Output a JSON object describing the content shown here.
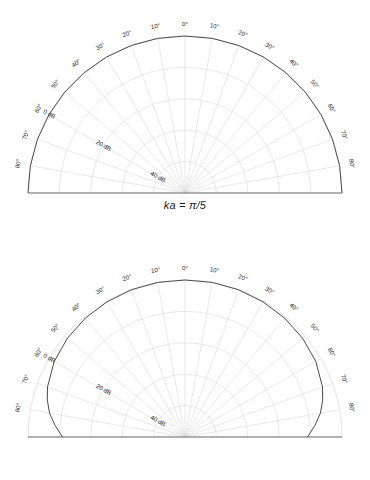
{
  "figure": {
    "type": "polar-directivity-figure",
    "background": "#ffffff",
    "panel_count": 2
  },
  "style": {
    "curve_color": "#4a4a4a",
    "grid_color": "#d9d9d9",
    "axis_color": "#6e6e6e",
    "text_color": "#2b2b2b"
  },
  "chart_data": [
    {
      "type": "line",
      "subtype": "polar-half",
      "title": "ka = π/5",
      "xlabel": "Angle (degrees)",
      "ylabel": "Level (dB)",
      "grid": true,
      "legend": null,
      "theta_range_deg": [
        -90,
        90
      ],
      "theta_tick_step_deg": 10,
      "theta_ticks_deg": [
        -80,
        -70,
        -60,
        -50,
        -40,
        -30,
        -20,
        -10,
        0,
        10,
        20,
        30,
        40,
        50,
        60,
        70,
        80
      ],
      "theta_tick_labels": [
        "80°",
        "70°",
        "60°",
        "50°",
        "40°",
        "30°",
        "20°",
        "10°",
        "0°",
        "10°",
        "20°",
        "30°",
        "40°",
        "50°",
        "60°",
        "70°",
        "80°"
      ],
      "radial_ticks_db": [
        0,
        20,
        40
      ],
      "radial_tick_labels": [
        "0 dB",
        "20 dB",
        "40 dB"
      ],
      "radial_label_angle_deg": -60,
      "radial_min_db": -50,
      "radial_max_db": 0,
      "ring_count": 5,
      "ring_step_db": 10,
      "series": [
        {
          "name": "ka = π/5",
          "theta_deg": [
            -90,
            -80,
            -70,
            -60,
            -50,
            -40,
            -30,
            -20,
            -10,
            0,
            10,
            20,
            30,
            40,
            50,
            60,
            70,
            80,
            90
          ],
          "values_db": [
            0,
            0,
            0,
            0,
            0,
            0,
            0,
            0,
            0,
            0,
            0,
            0,
            0,
            0,
            0,
            0,
            0,
            0,
            0
          ]
        }
      ]
    },
    {
      "type": "line",
      "subtype": "polar-half",
      "title": "ka = π",
      "xlabel": "Angle (degrees)",
      "ylabel": "Level (dB)",
      "grid": true,
      "legend": null,
      "theta_range_deg": [
        -90,
        90
      ],
      "theta_tick_step_deg": 10,
      "theta_ticks_deg": [
        -80,
        -70,
        -60,
        -50,
        -40,
        -30,
        -20,
        -10,
        0,
        10,
        20,
        30,
        40,
        50,
        60,
        70,
        80
      ],
      "theta_tick_labels": [
        "80°",
        "70°",
        "60°",
        "50°",
        "40°",
        "30°",
        "20°",
        "10°",
        "0°",
        "10°",
        "20°",
        "30°",
        "40°",
        "50°",
        "60°",
        "70°",
        "80°"
      ],
      "radial_ticks_db": [
        0,
        20,
        40
      ],
      "radial_tick_labels": [
        "0 dB",
        "20 dB",
        "40 dB"
      ],
      "radial_label_angle_deg": -60,
      "radial_min_db": -50,
      "radial_max_db": 0,
      "ring_count": 5,
      "ring_step_db": 10,
      "series": [
        {
          "name": "ka = π",
          "theta_deg": [
            -90,
            -85,
            -80,
            -75,
            -70,
            -60,
            -50,
            -40,
            -30,
            -20,
            -10,
            0,
            10,
            20,
            30,
            40,
            50,
            60,
            70,
            75,
            80,
            85,
            90
          ],
          "values_db": [
            -11.0,
            -8.5,
            -6.2,
            -4.6,
            -3.4,
            -1.9,
            -1.1,
            -0.6,
            -0.3,
            -0.1,
            0.0,
            0.0,
            0.0,
            -0.1,
            -0.3,
            -0.6,
            -1.1,
            -1.9,
            -3.4,
            -4.6,
            -6.2,
            -8.5,
            -11.0
          ]
        }
      ]
    }
  ],
  "panels": [
    {
      "caption": "ka = π/5"
    },
    {
      "caption": "ka = π"
    }
  ]
}
